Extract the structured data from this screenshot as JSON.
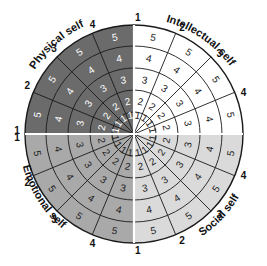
{
  "diagram": {
    "geometry": {
      "cx": 134,
      "cy": 134,
      "ring_radii": [
        22,
        44,
        66,
        88,
        109
      ],
      "sectors_per_quadrant": 4
    },
    "ring_labels": [
      "1",
      "2",
      "3",
      "4",
      "5"
    ],
    "quadrants": [
      {
        "name": "Intellectual self",
        "fill": "#ffffff",
        "text_color": "#222222",
        "start_angle": 0,
        "sector_labels": [
          "1",
          "2",
          "3",
          "4"
        ]
      },
      {
        "name": "Social self",
        "fill": "#dadada",
        "text_color": "#222222",
        "start_angle": 90,
        "sector_labels": [
          "4",
          "3",
          "2",
          "1"
        ]
      },
      {
        "name": "Emotional self",
        "fill": "#a9a9a9",
        "text_color": "#222222",
        "start_angle": 180,
        "sector_labels": [
          "4",
          "3",
          "2",
          "1"
        ]
      },
      {
        "name": "Physical self",
        "fill": "#6b6b6b",
        "text_color": "#ffffff",
        "start_angle": 270,
        "sector_labels": [
          "1",
          "2",
          "3",
          "4"
        ]
      }
    ],
    "colors": {
      "stroke": "#1a1a1a",
      "divider": "#ffffff"
    }
  }
}
